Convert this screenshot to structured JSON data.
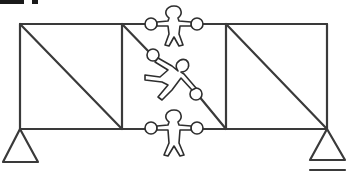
{
  "diagram": {
    "type": "truss-with-human-figures",
    "stroke_color": "#3a3a3a",
    "background": "#ffffff",
    "truss": {
      "top_chord_y": 24,
      "bottom_chord_y": 129,
      "nodes_x": [
        20,
        122,
        226,
        327
      ],
      "panels": [
        {
          "name": "left-panel",
          "diagonal": "top-left to bottom-right"
        },
        {
          "name": "middle-panel",
          "diagonal": "top-left to bottom-right (held by figure)"
        },
        {
          "name": "right-panel",
          "diagonal": "top-left to bottom-right"
        }
      ]
    },
    "supports": [
      {
        "name": "left-support",
        "type": "pin",
        "apex": [
          20,
          129
        ]
      },
      {
        "name": "right-support",
        "type": "roller",
        "apex": [
          327,
          129
        ]
      }
    ],
    "figures": [
      {
        "name": "top-figure",
        "position": "top chord, middle panel",
        "pose": "arms outstretched holding two nodes"
      },
      {
        "name": "diagonal-figure",
        "position": "middle panel diagonal",
        "pose": "leaning, holding diagonal member ends"
      },
      {
        "name": "bottom-figure",
        "position": "bottom chord, middle panel",
        "pose": "arms outstretched holding two nodes"
      }
    ],
    "text_fragment": ""
  }
}
